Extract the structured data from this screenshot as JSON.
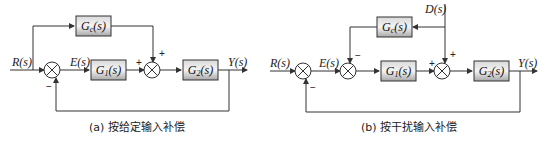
{
  "diagram_a": {
    "caption": "(a) 按给定输入补偿",
    "input_label": "R(s)",
    "error_label": "E(s)",
    "output_label": "Y(s)",
    "blocks": {
      "gc": {
        "name": "G",
        "sub": "c",
        "arg": "(s)"
      },
      "g1": {
        "name": "G",
        "sub": "1",
        "arg": "(s)"
      },
      "g2": {
        "name": "G",
        "sub": "2",
        "arg": "(s)"
      }
    },
    "signs": {
      "feedback": "−",
      "sum2_left": "+",
      "sum2_top": "+"
    }
  },
  "diagram_b": {
    "caption": "(b) 按干扰输入补偿",
    "input_label": "R(s)",
    "error_label": "E(s)",
    "output_label": "Y(s)",
    "disturbance_label": "D(s)",
    "blocks": {
      "gc": {
        "name": "G",
        "sub": "c",
        "arg": "(s)"
      },
      "g1": {
        "name": "G",
        "sub": "1",
        "arg": "(s)"
      },
      "g2": {
        "name": "G",
        "sub": "2",
        "arg": "(s)"
      }
    },
    "signs": {
      "feedback": "−",
      "sum2_top": "−",
      "sum3_left": "+",
      "sum3_top": "+"
    }
  },
  "colors": {
    "line": "#333333",
    "block_light": "#f2f2f2",
    "block_dark": "#9a9a9a"
  }
}
